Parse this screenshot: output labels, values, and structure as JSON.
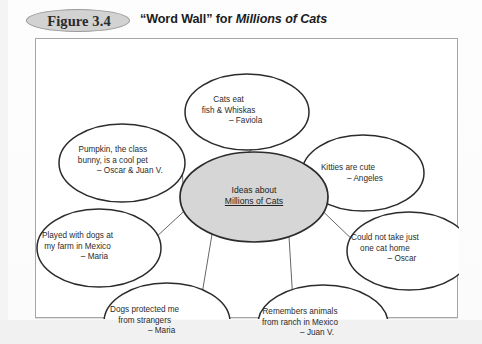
{
  "figure": {
    "badge_label": "Figure 3.4",
    "caption_quote": "“Word Wall” for ",
    "caption_title_italic": "Millions of Cats"
  },
  "colors": {
    "center_fill": "#d6d6d6",
    "center_stroke": "#2b2b2b",
    "node_stroke": "#2b2b2b",
    "spoke_stroke": "#555555",
    "frame_border": "#a6a6a6",
    "badge_fill": "#d2d2d2",
    "badge_border": "#9a9a9a",
    "text": "#2c2c2c",
    "page_background": "#ffffff"
  },
  "diagram": {
    "type": "word-wall-web",
    "center": {
      "label_line1": "Ideas about",
      "label_line2": "Millions of Cats",
      "cx": 218,
      "cy": 158,
      "rx": 74,
      "ry": 45
    },
    "nodes": [
      {
        "id": "node-cats-eat",
        "name": "cats-eat-fish-whiskas",
        "lines": [
          "Cats eat",
          "fish & Whiskas"
        ],
        "attribution": "– Faviola",
        "cx": 211,
        "cy": 73,
        "rx": 62,
        "ry": 38,
        "text_left": 159,
        "text_top": 56
      },
      {
        "id": "node-pumpkin",
        "name": "pumpkin-class-bunny",
        "lines": [
          "Pumpkin, the class",
          "bunny, is a cool pet"
        ],
        "attribution": "– Oscar & Juan V.",
        "cx": 86,
        "cy": 124,
        "rx": 63,
        "ry": 39,
        "text_left": 27,
        "text_top": 106
      },
      {
        "id": "node-kitties",
        "name": "kitties-are-cute",
        "lines": [
          "Kitties are cute"
        ],
        "attribution": "– Angeles",
        "cx": 327,
        "cy": 134,
        "rx": 61,
        "ry": 38,
        "text_left": 277,
        "text_top": 124
      },
      {
        "id": "node-played-dogs",
        "name": "played-with-dogs-farm-mexico",
        "lines": [
          "Played with dogs at",
          "my farm in Mexico"
        ],
        "attribution": "– Maria",
        "cx": 63,
        "cy": 209,
        "rx": 62,
        "ry": 39,
        "text_left": 6,
        "text_top": 192
      },
      {
        "id": "node-could-not-take",
        "name": "could-not-take-just-one-cat",
        "lines": [
          "Could not take just",
          "one cat home"
        ],
        "attribution": "– Oscar",
        "cx": 373,
        "cy": 212,
        "rx": 62,
        "ry": 39,
        "text_left": 315,
        "text_top": 194
      },
      {
        "id": "node-dogs-protected",
        "name": "dogs-protected-me",
        "lines": [
          "Dogs protected me",
          "from strangers"
        ],
        "attribution": "– Maria",
        "cx": 131,
        "cy": 283,
        "rx": 63,
        "ry": 39,
        "text_left": 74,
        "text_top": 266
      },
      {
        "id": "node-remembers-animals",
        "name": "remembers-animals-ranch-mexico",
        "lines": [
          "Remembers animals",
          "from ranch in Mexico"
        ],
        "attribution": "– Juan V.",
        "cx": 287,
        "cy": 285,
        "rx": 65,
        "ry": 39,
        "text_left": 226,
        "text_top": 268
      }
    ],
    "spokes": [
      {
        "name": "spoke-to-cats-eat",
        "x1": 211,
        "y1": 111,
        "x2": 213,
        "y2": 114
      },
      {
        "name": "spoke-to-pumpkin",
        "x1": 136,
        "y1": 149,
        "x2": 151,
        "y2": 132
      },
      {
        "name": "spoke-to-kitties",
        "x1": 280,
        "y1": 140,
        "x2": 268,
        "y2": 166
      },
      {
        "name": "spoke-to-played-dogs",
        "x1": 125,
        "y1": 200,
        "x2": 146,
        "y2": 196
      },
      {
        "name": "spoke-to-could-not-take",
        "x1": 292,
        "y1": 193,
        "x2": 311,
        "y2": 197
      },
      {
        "name": "spoke-to-dogs-protected",
        "x1": 163,
        "y1": 252,
        "x2": 188,
        "y2": 199
      },
      {
        "name": "spoke-to-remembers-animals",
        "x1": 262,
        "y1": 250,
        "x2": 244,
        "y2": 199
      }
    ]
  }
}
